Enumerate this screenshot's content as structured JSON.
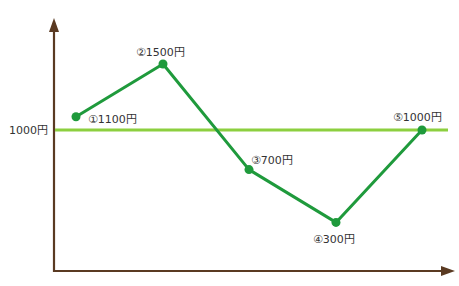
{
  "chart_data": {
    "type": "line",
    "title": "",
    "xlabel": "",
    "ylabel": "",
    "categories": [
      "①",
      "②",
      "③",
      "④",
      "⑤"
    ],
    "series": [
      {
        "name": "price",
        "values": [
          1100,
          1500,
          700,
          300,
          1000
        ],
        "color": "#1f9a3c"
      }
    ],
    "reference_line": {
      "value": 1000,
      "label": "1000円",
      "color": "#8ccf3f"
    },
    "point_labels": [
      "①1100円",
      "②1500円",
      "③700円",
      "④300円",
      "⑤1000円"
    ],
    "axis_color": "#5a3a22",
    "grid": false,
    "legend": "none"
  }
}
